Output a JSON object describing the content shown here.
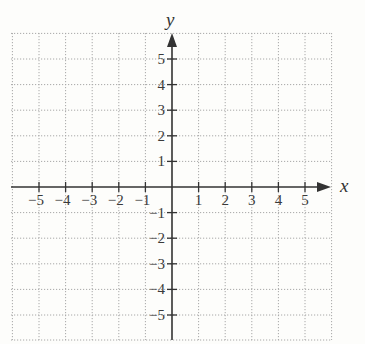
{
  "chart_data": {
    "type": "coordinate-grid",
    "title": "",
    "xlabel": "x",
    "ylabel": "y",
    "xlim": [
      -6,
      6
    ],
    "ylim": [
      -6,
      6
    ],
    "grid": true,
    "grid_style": "dotted",
    "x_ticks": [
      -5,
      -4,
      -3,
      -2,
      -1,
      1,
      2,
      3,
      4,
      5
    ],
    "y_ticks": [
      5,
      4,
      3,
      2,
      1,
      -1,
      -2,
      -3,
      -4,
      -5
    ],
    "x_tick_labels": [
      "−5",
      "−4",
      "−3",
      "−2",
      "−1",
      "1",
      "2",
      "3",
      "4",
      "5"
    ],
    "y_tick_labels": [
      "5",
      "4",
      "3",
      "2",
      "1",
      "−1",
      "−2",
      "−3",
      "−4",
      "−5"
    ],
    "series": [],
    "colors": {
      "axis": "#333333",
      "grid": "#a8a8a8",
      "background": "#fdfdfb"
    }
  },
  "labels": {
    "x_axis": "x",
    "y_axis": "y"
  }
}
